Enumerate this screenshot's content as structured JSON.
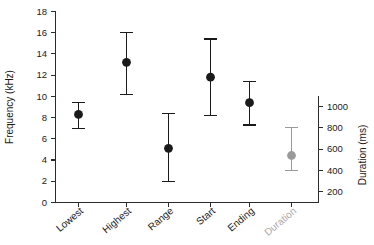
{
  "chart_data": {
    "type": "scatter",
    "title": "",
    "subtitle": "",
    "xlabel": "",
    "ylabel": "Frequency (kHz)",
    "y2label": "Duration (ms)",
    "ylim": [
      0,
      18
    ],
    "y2lim": [
      0,
      1130
    ],
    "yticks": [
      0,
      2,
      4,
      6,
      8,
      10,
      12,
      14,
      16,
      18
    ],
    "ytick_labels": [
      "0",
      "2",
      "4",
      "6",
      "8",
      "10",
      "12",
      "14",
      "16",
      "18"
    ],
    "y2ticks": [
      200,
      400,
      600,
      800,
      1000
    ],
    "y2tick_labels": [
      "200",
      "400",
      "600",
      "800",
      "1000"
    ],
    "grid": false,
    "legend": "none",
    "categories": [
      "Lowest",
      "Highest",
      "Range",
      "Start",
      "Ending",
      "Duration"
    ],
    "series": [
      {
        "name": "Frequency measures",
        "axis": "left",
        "units": "kHz",
        "marker": "filled-circle",
        "color": "#1a1a1a",
        "points": [
          {
            "category": "Lowest",
            "value": 8.3,
            "low": 7.0,
            "high": 9.4
          },
          {
            "category": "Highest",
            "value": 13.2,
            "low": 10.2,
            "high": 16.0
          },
          {
            "category": "Range",
            "value": 5.1,
            "low": 2.0,
            "high": 8.4
          },
          {
            "category": "Start",
            "value": 11.8,
            "low": 8.2,
            "high": 15.4
          },
          {
            "category": "Ending",
            "value": 9.4,
            "low": 7.3,
            "high": 11.4
          }
        ]
      },
      {
        "name": "Duration",
        "axis": "right",
        "units": "ms",
        "marker": "filled-circle",
        "color": "#9a9a9a",
        "points": [
          {
            "category": "Duration",
            "value": 540,
            "low": 400,
            "high": 800
          }
        ]
      }
    ]
  },
  "axes": {
    "left_title": "Frequency (kHz)",
    "right_title": "Duration (ms)"
  },
  "category_labels": {
    "c0": "Lowest",
    "c1": "Highest",
    "c2": "Range",
    "c3": "Start",
    "c4": "Ending",
    "c5": "Duration"
  },
  "ytick_text": {
    "t0": "0",
    "t1": "2",
    "t2": "4",
    "t3": "6",
    "t4": "8",
    "t5": "10",
    "t6": "12",
    "t7": "14",
    "t8": "16",
    "t9": "18"
  },
  "y2tick_text": {
    "t0": "200",
    "t1": "400",
    "t2": "600",
    "t3": "800",
    "t4": "1000"
  },
  "colors": {
    "frequency_marker": "#1a1a1a",
    "duration_marker": "#9a9a9a",
    "axis": "#2b2b2b",
    "background": "#ffffff"
  }
}
